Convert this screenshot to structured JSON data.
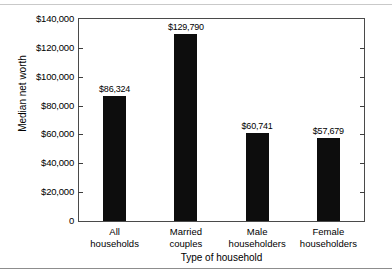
{
  "chart_data": {
    "type": "bar",
    "title": "",
    "categories": [
      "All\nhouseholds",
      "Married\ncouples",
      "Male\nhouseholders",
      "Female\nhouseholders"
    ],
    "values": [
      86324,
      129790,
      60741,
      57679
    ],
    "data_labels": [
      "$86,324",
      "$129,790",
      "$60,741",
      "$57,679"
    ],
    "xlabel": "Type of household",
    "ylabel": "Median net worth",
    "ylim": [
      0,
      140000
    ],
    "ytick_values": [
      0,
      20000,
      40000,
      60000,
      80000,
      100000,
      120000,
      140000
    ],
    "ytick_labels": [
      "0",
      "$20,000",
      "$40,000",
      "$60,000",
      "$80,000",
      "$100,000",
      "$120,000",
      "$140,000"
    ],
    "grid": false,
    "legend": false,
    "bar_color": "#0d0d0d",
    "axis_color": "#4a4a4a",
    "background_color": "#ffffff"
  }
}
